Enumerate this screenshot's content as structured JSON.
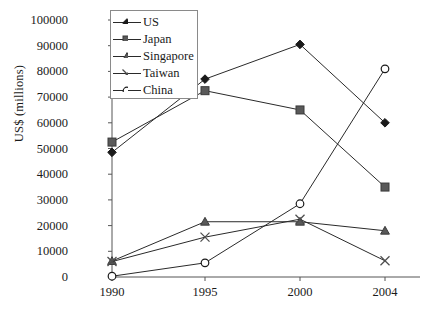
{
  "chart_data": {
    "type": "line",
    "title": "",
    "xlabel": "",
    "ylabel": "US$ (millions)",
    "categories": [
      "1990",
      "1995",
      "2000",
      "2004"
    ],
    "x": [
      1990,
      1995,
      2000,
      2004
    ],
    "ylim": [
      0,
      100000
    ],
    "ytick_labels": [
      "0",
      "10000",
      "20000",
      "30000",
      "40000",
      "50000",
      "60000",
      "70000",
      "80000",
      "90000",
      "100000"
    ],
    "yticks": [
      0,
      10000,
      20000,
      30000,
      40000,
      50000,
      60000,
      70000,
      80000,
      90000,
      100000
    ],
    "grid": false,
    "legend_position": "top-left-inside",
    "series": [
      {
        "name": "US",
        "marker": "diamond",
        "color": "#1a1a1a",
        "values": [
          48500,
          77000,
          90500,
          60000
        ]
      },
      {
        "name": "Japan",
        "marker": "square",
        "color": "#595959",
        "values": [
          52500,
          72500,
          65000,
          35000
        ]
      },
      {
        "name": "Singapore",
        "marker": "triangle",
        "color": "#595959",
        "values": [
          6200,
          21500,
          21500,
          18000
        ]
      },
      {
        "name": "Taiwan",
        "marker": "cross",
        "color": "#4d4d4d",
        "values": [
          6000,
          15500,
          22500,
          6300
        ]
      },
      {
        "name": "China",
        "marker": "circle",
        "color": "#1a1a1a",
        "values": [
          300,
          5500,
          28500,
          81000
        ]
      }
    ]
  },
  "legend": {
    "items": [
      {
        "label": "US"
      },
      {
        "label": "Japan"
      },
      {
        "label": "Singapore"
      },
      {
        "label": "Taiwan"
      },
      {
        "label": "China"
      }
    ]
  }
}
